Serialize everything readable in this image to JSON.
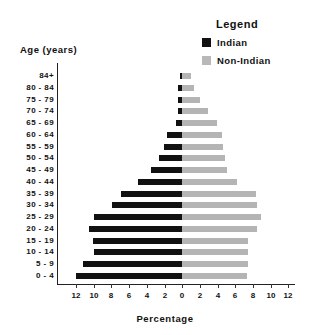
{
  "legend": {
    "title": "Legend",
    "items": [
      {
        "label": "Indian",
        "color": "#111111",
        "pattern": "solid"
      },
      {
        "label": "Non-Indian",
        "color": "#e6e6e6",
        "pattern": "stipple"
      }
    ]
  },
  "axes": {
    "ylabel": "Age (years)",
    "xlabel": "Percentage",
    "xticks": [
      "12",
      "10",
      "8",
      "6",
      "4",
      "2",
      "0",
      "2",
      "4",
      "6",
      "8",
      "10",
      "12"
    ]
  },
  "chart_data": {
    "type": "bar",
    "subtype": "population-pyramid",
    "title": "",
    "xlabel": "Percentage",
    "ylabel": "Age (years)",
    "xlim": [
      -12,
      12
    ],
    "orientation": "horizontal",
    "legend_position": "top-right",
    "legend_title": "Legend",
    "grid": false,
    "categories": [
      "84+",
      "80 - 84",
      "75 - 79",
      "70 - 74",
      "65 - 69",
      "60 - 64",
      "55 - 59",
      "50 - 54",
      "45 - 49",
      "40 - 44",
      "35 - 39",
      "30 - 34",
      "25 - 29",
      "20 - 24",
      "15 - 19",
      "10 - 14",
      "5 - 9",
      "0 - 4"
    ],
    "series": [
      {
        "name": "Indian",
        "side": "left",
        "values": [
          0.2,
          0.4,
          0.5,
          0.4,
          0.7,
          1.7,
          2.0,
          2.6,
          3.5,
          5.0,
          6.9,
          8.0,
          10.0,
          10.6,
          10.1,
          10.0,
          11.3,
          12.0
        ]
      },
      {
        "name": "Non-Indian",
        "side": "right",
        "values": [
          1.0,
          1.4,
          2.0,
          3.0,
          4.0,
          4.5,
          4.7,
          4.9,
          5.1,
          6.2,
          8.4,
          8.5,
          9.0,
          8.5,
          7.5,
          7.5,
          7.5,
          7.4
        ]
      }
    ]
  }
}
